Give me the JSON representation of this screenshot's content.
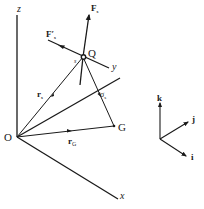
{
  "diagram": {
    "axes": {
      "z": "z",
      "y": "y",
      "x": "x"
    },
    "points": {
      "origin": "O",
      "q": "Q",
      "g": "G"
    },
    "vectors": {
      "r_s": "r",
      "r_s_sub": "s",
      "r_g": "r",
      "r_g_sub": "G",
      "sigma": "σ",
      "sigma_sub": "s",
      "f_s": "F",
      "f_s_sub": "s",
      "f_s_prime": "F′",
      "f_s_prime_sub": "s",
      "s_small": "s"
    },
    "unit_vectors": {
      "k": "k",
      "j": "j",
      "i": "i"
    },
    "colors": {
      "ink": "#1a1a1a",
      "background": "#ffffff"
    }
  }
}
